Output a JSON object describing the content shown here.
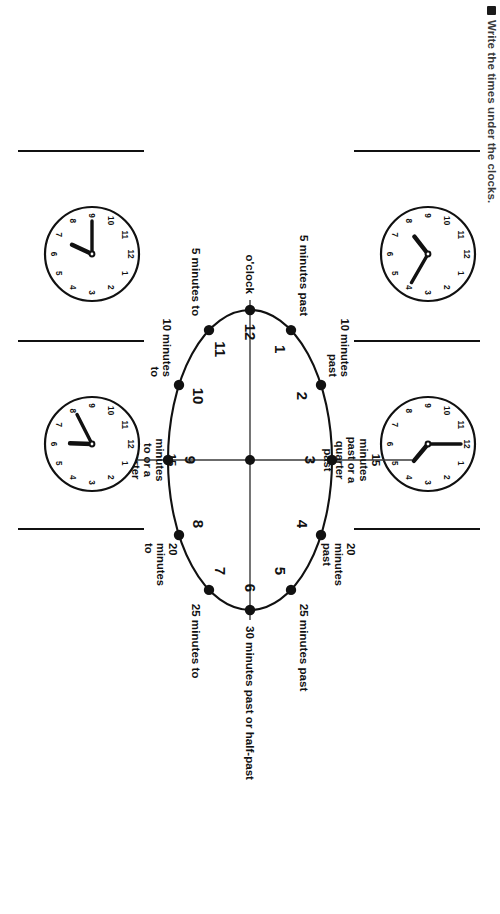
{
  "worksheet": {
    "instruction": "Write the times under the clocks.",
    "bullet_icon": "square-bullet-icon"
  },
  "diagram": {
    "name": "clock-minutes-circle",
    "center_label": "",
    "hours": [
      "12",
      "1",
      "2",
      "3",
      "4",
      "5",
      "6",
      "7",
      "8",
      "9",
      "10",
      "11"
    ],
    "labels": [
      {
        "hour": "12",
        "text": "o'clock",
        "lines": [
          "o'clock"
        ]
      },
      {
        "hour": "1",
        "text": "5 minutes past",
        "lines": [
          "5 minutes past"
        ]
      },
      {
        "hour": "2",
        "text": "10 minutes past",
        "lines": [
          "10 minutes",
          "past"
        ]
      },
      {
        "hour": "3",
        "text": "15 minutes past or a quarter past",
        "lines": [
          "15",
          "minutes",
          "past or a",
          "quarter",
          "past"
        ]
      },
      {
        "hour": "4",
        "text": "20 minutes past",
        "lines": [
          "20",
          "minutes",
          "past"
        ]
      },
      {
        "hour": "5",
        "text": "25 minutes past",
        "lines": [
          "25 minutes past"
        ]
      },
      {
        "hour": "6",
        "text": "30 minutes past or half-past",
        "lines": [
          "30 minutes past or half-past"
        ]
      },
      {
        "hour": "7",
        "text": "25 minutes to",
        "lines": [
          "25 minutes to"
        ]
      },
      {
        "hour": "8",
        "text": "20 minutes to",
        "lines": [
          "20",
          "minutes",
          "to"
        ]
      },
      {
        "hour": "9",
        "text": "15 minutes to or a quarter to",
        "lines": [
          "15",
          "minutes",
          "to or a",
          "quarter",
          "to"
        ]
      },
      {
        "hour": "10",
        "text": "10 minutes to",
        "lines": [
          "10 minutes",
          "to"
        ]
      },
      {
        "hour": "11",
        "text": "5 minutes to",
        "lines": [
          "5 minutes to"
        ]
      }
    ]
  },
  "clock_rows": [
    {
      "row": "top",
      "clocks": [
        {
          "name": "clock-a",
          "hour_angle": 232,
          "minute_angle": 120,
          "reads": "7:40"
        },
        {
          "name": "clock-b",
          "hour_angle": 130,
          "minute_angle": 0,
          "reads": "4:00"
        }
      ]
    },
    {
      "row": "bottom",
      "clocks": [
        {
          "name": "clock-c",
          "hour_angle": 205,
          "minute_angle": 270,
          "reads": "6:45"
        },
        {
          "name": "clock-d",
          "hour_angle": 182,
          "minute_angle": 243,
          "reads": "6:20"
        }
      ]
    }
  ],
  "colors": {
    "ink": "#111111",
    "rule": "#3a3a3a",
    "paper": "#ffffff"
  }
}
